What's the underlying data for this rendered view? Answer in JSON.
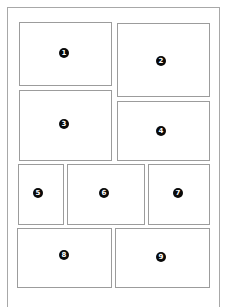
{
  "diagram": {
    "title": "",
    "frame_color": "#a8a8a8",
    "panel_border_color": "#9c9c9c",
    "badge_color": "#0a0a0a",
    "panels": [
      {
        "number": "1",
        "x": 19,
        "y": 22,
        "w": 93,
        "h": 64,
        "badge_x": 64,
        "badge_y": 53
      },
      {
        "number": "2",
        "x": 117,
        "y": 23,
        "w": 93,
        "h": 74,
        "badge_x": 161,
        "badge_y": 61
      },
      {
        "number": "3",
        "x": 19,
        "y": 90,
        "w": 93,
        "h": 71,
        "badge_x": 64,
        "badge_y": 124
      },
      {
        "number": "4",
        "x": 117,
        "y": 101,
        "w": 93,
        "h": 60,
        "badge_x": 161,
        "badge_y": 131
      },
      {
        "number": "5",
        "x": 18,
        "y": 164,
        "w": 46,
        "h": 61,
        "badge_x": 38,
        "badge_y": 193
      },
      {
        "number": "6",
        "x": 67,
        "y": 164,
        "w": 78,
        "h": 61,
        "badge_x": 104,
        "badge_y": 193
      },
      {
        "number": "7",
        "x": 148,
        "y": 164,
        "w": 62,
        "h": 61,
        "badge_x": 178,
        "badge_y": 193
      },
      {
        "number": "8",
        "x": 17,
        "y": 228,
        "w": 95,
        "h": 60,
        "badge_x": 64,
        "badge_y": 255
      },
      {
        "number": "9",
        "x": 115,
        "y": 228,
        "w": 95,
        "h": 60,
        "badge_x": 161,
        "badge_y": 257
      }
    ]
  }
}
